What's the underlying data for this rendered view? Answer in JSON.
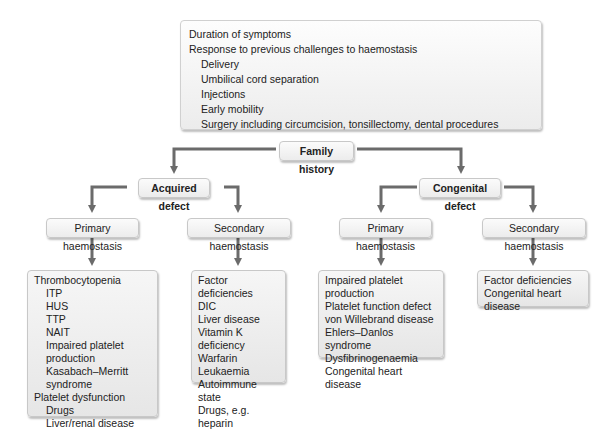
{
  "top_box": {
    "items": [
      {
        "text": "Duration of symptoms",
        "level": 0
      },
      {
        "text": "Response to previous challenges to haemostasis",
        "level": 0
      },
      {
        "text": "Delivery",
        "level": 1
      },
      {
        "text": "Umbilical cord separation",
        "level": 1
      },
      {
        "text": "Injections",
        "level": 1
      },
      {
        "text": "Early mobility",
        "level": 1
      },
      {
        "text": "Surgery including circumcision, tonsillectomy, dental procedures",
        "level": 1
      }
    ]
  },
  "family_history": {
    "label": "Family history"
  },
  "acquired": {
    "label": "Acquired defect",
    "primary": {
      "label": "Primary haemostasis",
      "items": [
        {
          "text": "Thrombocytopenia",
          "level": 0
        },
        {
          "text": "ITP",
          "level": 1
        },
        {
          "text": "HUS",
          "level": 1
        },
        {
          "text": "TTP",
          "level": 1
        },
        {
          "text": "NAIT",
          "level": 1
        },
        {
          "text": "Impaired platelet production",
          "level": 1
        },
        {
          "text": "Kasabach–Merritt syndrome",
          "level": 1
        },
        {
          "text": "Platelet dysfunction",
          "level": 0
        },
        {
          "text": "Drugs",
          "level": 1
        },
        {
          "text": "Liver/renal disease",
          "level": 1
        },
        {
          "text": "Acquired von Willebrand disease",
          "level": 0
        }
      ]
    },
    "secondary": {
      "label": "Secondary haemostasis",
      "items": [
        {
          "text": "Factor deficiencies",
          "level": 0
        },
        {
          "text": "DIC",
          "level": 0
        },
        {
          "text": "Liver disease",
          "level": 0
        },
        {
          "text": "Vitamin K deficiency",
          "level": 0
        },
        {
          "text": "Warfarin",
          "level": 0
        },
        {
          "text": "Leukaemia",
          "level": 0
        },
        {
          "text": "Autoimmune state",
          "level": 0
        },
        {
          "text": "Drugs, e.g. heparin",
          "level": 0
        }
      ]
    }
  },
  "congenital": {
    "label": "Congenital defect",
    "primary": {
      "label": "Primary haemostasis",
      "items": [
        {
          "text": "Impaired platelet production",
          "level": 0
        },
        {
          "text": "Platelet function defect",
          "level": 0
        },
        {
          "text": "von Willebrand disease",
          "level": 0
        },
        {
          "text": "Ehlers–Danlos syndrome",
          "level": 0
        },
        {
          "text": "Dysfibrinogenaemia",
          "level": 0
        },
        {
          "text": "Congenital heart disease",
          "level": 0
        }
      ]
    },
    "secondary": {
      "label": "Secondary haemostasis",
      "items": [
        {
          "text": "Factor deficiencies",
          "level": 0
        },
        {
          "text": "Congenital heart disease",
          "level": 0
        }
      ]
    }
  },
  "colors": {
    "connector": "#6b6b6b",
    "box_border": "#c8c8c8",
    "text": "#222222"
  }
}
